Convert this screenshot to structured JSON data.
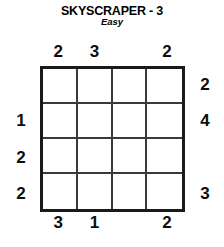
{
  "header": {
    "title": "SKYSCRAPER - 3",
    "difficulty": "Easy"
  },
  "puzzle": {
    "type": "skyscraper",
    "size": 4,
    "cells_filled": false,
    "grid_values": [
      [
        "",
        "",
        "",
        ""
      ],
      [
        "",
        "",
        "",
        ""
      ],
      [
        "",
        "",
        "",
        ""
      ],
      [
        "",
        "",
        "",
        ""
      ]
    ],
    "clues": {
      "top": [
        "2",
        "3",
        "",
        "2"
      ],
      "left": [
        "",
        "1",
        "2",
        "2"
      ],
      "right": [
        "2",
        "4",
        "",
        "3"
      ],
      "bottom": [
        "3",
        "1",
        "",
        "2"
      ]
    }
  },
  "colors": {
    "background": "#ffffff",
    "ink": "#000000",
    "grid_outer": "#1a1a1a",
    "grid_inner": "#3a3a3a"
  }
}
